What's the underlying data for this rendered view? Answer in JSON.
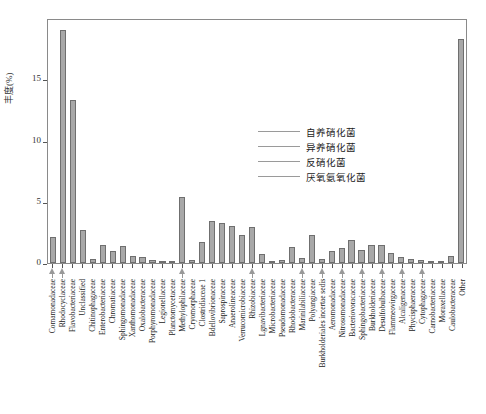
{
  "chart_data": {
    "type": "bar",
    "title": "",
    "xlabel": "",
    "ylabel": "丰度(%)",
    "ylim": [
      0,
      20
    ],
    "yticks": [
      0,
      5,
      10,
      15
    ],
    "grid": false,
    "legend_position": "inside-right",
    "categories": [
      "Comamonadaceae",
      "Rhodocyclaceae",
      "Flavobacteriaceae",
      "Unclassified",
      "Chitinophagaceae",
      "Enterobacteriaceae",
      "Chromatiaceae",
      "Sphingomonadaceae",
      "Xanthomonadaceae",
      "Oxalobacteraceae",
      "Porphyromonadaceae",
      "Legionellaceae",
      "Planctomycetaceae",
      "Methylophilaceae",
      "Cryomorphaceae",
      "Clostridiaceae 1",
      "Bdellovibrionaceae",
      "Saprospiraceae",
      "Anaerolineaceae",
      "Verrucomicrobiaceae",
      "Rhizobiaceae",
      "Lgnavibacteriaceae",
      "Microbacteriaceae",
      "Pseudomonadaceae",
      "Rhodobacteraceae",
      "Marinilabiliaceae",
      "Polyangiaceae",
      "Burkholderiales incertae sedis",
      "Aeromonadaceae",
      "Nitrosomonadaceae",
      "Bacteriovoracaceae",
      "Sphingobacteriaceae",
      "Burkholderiaceae",
      "Desulfobulbaceae",
      "Flammeovirgaceae",
      "Alcaligenaceae",
      "Phycisphaeraceae",
      "Cytophagaceae",
      "Carnobacteriaceae",
      "Moraxellaceae",
      "Caulobacteraceae",
      "Other"
    ],
    "values": [
      2.1,
      19.0,
      13.3,
      2.7,
      0.35,
      1.5,
      1.0,
      1.4,
      0.6,
      0.5,
      0.25,
      0.2,
      0.15,
      5.4,
      0.25,
      1.7,
      3.4,
      3.3,
      3.0,
      2.3,
      2.9,
      0.75,
      0.2,
      0.25,
      1.3,
      0.45,
      2.25,
      0.3,
      1.0,
      1.25,
      1.85,
      1.05,
      1.5,
      1.5,
      0.85,
      0.5,
      0.3,
      0.25,
      0.1,
      0.12,
      0.55,
      18.3
    ],
    "marked_indices": [
      0,
      1,
      13,
      20,
      25,
      27,
      29,
      31,
      33,
      35,
      37
    ],
    "series_name": "丰度",
    "bar_color": "#a8a8a8",
    "bar_border_color": "#6f6f6f",
    "axis_color": "#8a8a8a"
  },
  "legend": {
    "items": [
      {
        "label": "自养硝化菌",
        "line_color": "#9a9a9a"
      },
      {
        "label": "异养硝化菌",
        "line_color": "#9a9a9a"
      },
      {
        "label": "反硝化菌",
        "line_color": "#9a9a9a"
      },
      {
        "label": "厌氧氨氧化菌",
        "line_color": "#9a9a9a"
      }
    ]
  }
}
